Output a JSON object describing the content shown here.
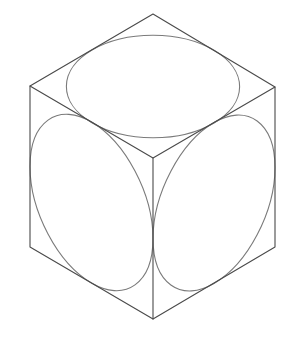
{
  "diagram": {
    "title": "Isometric cube with inscribed circles on three visible faces",
    "colors": {
      "background": "#ffffff",
      "edge": "#4a4a4a",
      "circle": "#7a7a7a"
    },
    "vertices": {
      "top": [
        153,
        14
      ],
      "top_left": [
        30,
        86
      ],
      "top_right": [
        275,
        87
      ],
      "center": [
        153,
        158
      ],
      "bottom_left": [
        30,
        247
      ],
      "bottom_right": [
        275,
        247
      ],
      "bottom": [
        153,
        319
      ]
    },
    "faces": [
      {
        "name": "top",
        "center": [
          153,
          86.5
        ],
        "u": [
          61.5,
          -36
        ],
        "v": [
          61,
          36.5
        ]
      },
      {
        "name": "left",
        "center": [
          91.5,
          202.5
        ],
        "u": [
          61.5,
          36
        ],
        "v": [
          0,
          80.5
        ]
      },
      {
        "name": "right",
        "center": [
          214,
          203
        ],
        "u": [
          61,
          -35.5
        ],
        "v": [
          0,
          80.5
        ]
      }
    ]
  }
}
